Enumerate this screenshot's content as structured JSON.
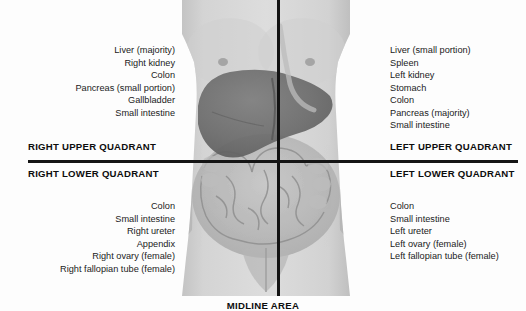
{
  "figure": {
    "midline_label": "MIDLINE AREA",
    "body_image_alt": "anterior view of human torso with abdominal organs overlaid"
  },
  "quadrants": {
    "right_upper": {
      "heading": "RIGHT UPPER QUADRANT",
      "organs": [
        "Liver (majority)",
        "Right kidney",
        "Colon",
        "Pancreas (small portion)",
        "Gallbladder",
        "Small intestine"
      ]
    },
    "left_upper": {
      "heading": "LEFT UPPER QUADRANT",
      "organs": [
        "Liver (small portion)",
        "Spleen",
        "Left kidney",
        "Stomach",
        "Colon",
        "Pancreas (majority)",
        "Small intestine"
      ]
    },
    "right_lower": {
      "heading": "RIGHT LOWER QUADRANT",
      "organs": [
        "Colon",
        "Small intestine",
        "Right ureter",
        "Appendix",
        "Right ovary (female)",
        "Right fallopian tube (female)"
      ]
    },
    "left_lower": {
      "heading": "LEFT LOWER QUADRANT",
      "organs": [
        "Colon",
        "Small intestine",
        "Left ureter",
        "Left ovary (female)",
        "Left fallopian tube (female)"
      ]
    }
  },
  "colors": {
    "background": "#ffffff",
    "divider": "#121212",
    "text": "#1b1b1b",
    "heading": "#0d0d0d",
    "skin_light": "#d9d9d9",
    "skin_mid": "#c2c2c2",
    "skin_shadow": "#a8a8a8",
    "liver": "#6f6f6f",
    "intestine": "#b4b4b4"
  }
}
